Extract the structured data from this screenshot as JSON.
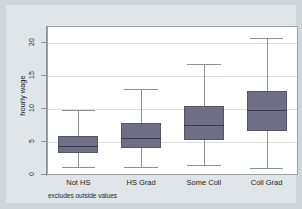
{
  "chart_data": {
    "type": "box",
    "title": "",
    "xlabel": "",
    "ylabel": "hourly wage",
    "note": "excludes outside values",
    "ylim": [
      0,
      21
    ],
    "yticks": [
      0,
      5,
      10,
      15,
      20
    ],
    "ytick_labels": [
      "0",
      "5",
      "10",
      "15",
      "20"
    ],
    "grid": true,
    "legend": "none",
    "categories": [
      "Not HS",
      "HS Grad",
      "Some Coll",
      "Coll Grad"
    ],
    "boxes": [
      {
        "category": "Not HS",
        "whisker_low": 1.0,
        "q1": 3.2,
        "median": 4.3,
        "q3": 5.8,
        "whisker_high": 9.7
      },
      {
        "category": "HS Grad",
        "whisker_low": 1.1,
        "q1": 3.9,
        "median": 5.4,
        "q3": 7.7,
        "whisker_high": 12.8
      },
      {
        "category": "Some Coll",
        "whisker_low": 1.4,
        "q1": 5.2,
        "median": 7.4,
        "q3": 10.2,
        "whisker_high": 16.6
      },
      {
        "category": "Coll Grad",
        "whisker_low": 0.9,
        "q1": 6.5,
        "median": 9.7,
        "q3": 12.5,
        "whisker_high": 20.6
      }
    ],
    "colors": {
      "box_fill": "#6e6e86",
      "box_edge": "#55556a",
      "median": "#3a3a48",
      "whisker": "#8b9096",
      "grid": "#dadde0",
      "plot_background": "#ffffff",
      "figure_background": "#dfe5e8",
      "page_background": "#ced6da",
      "axis": "#8d959b"
    }
  }
}
